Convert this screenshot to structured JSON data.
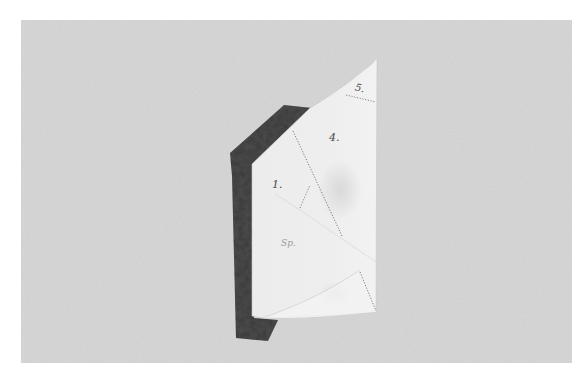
{
  "image": {
    "subject": "folded paper pattern piece over a dark fabric strip",
    "background_color": "#d9d9d9",
    "border_color": "#ffffff",
    "paper_color": "#ededed",
    "strip_color": "#4a4a4a"
  },
  "labels": {
    "five": "5.",
    "four": "4.",
    "one": "1.",
    "sp": "Sp."
  }
}
